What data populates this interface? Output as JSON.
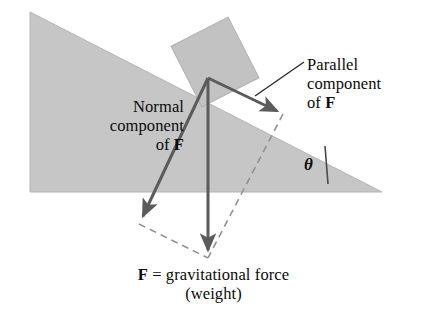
{
  "figure": {
    "background_color": "#ffffff",
    "wedge_fill": "#c6c6c6",
    "block_fill": "#c0c0c0",
    "vector_color": "#5b5b5b",
    "dashed_color": "#8f8f8f",
    "text_color": "#0b0b0b"
  },
  "labels": {
    "normal_line1": "Normal",
    "normal_line2": "component",
    "normal_line3_prefix": "of ",
    "normal_line3_symbol": "F",
    "parallel_line1": "Parallel",
    "parallel_line2": "component",
    "parallel_line3_prefix": "of ",
    "parallel_line3_symbol": "F",
    "theta": "θ",
    "caption_symbol": "F",
    "caption_line1": " = gravitational force",
    "caption_line2": "(weight)"
  },
  "geometry": {
    "wedge_points": "30,12 382,192 30,192",
    "incline_angle_degrees": 27,
    "block_center_x": 215,
    "block_center_y": 62,
    "vector_origin_x": 208,
    "vector_origin_y": 78
  },
  "vectors": [
    {
      "name": "gravitational-force",
      "label": "F = gravitational force (weight)",
      "from_x": 208,
      "from_y": 78,
      "to_x": 208,
      "to_y": 258,
      "style": "solid"
    },
    {
      "name": "normal-component",
      "label": "Normal component of F",
      "from_x": 208,
      "from_y": 78,
      "to_x": 139,
      "to_y": 224,
      "style": "solid"
    },
    {
      "name": "parallel-component",
      "label": "Parallel component of F",
      "from_x": 208,
      "from_y": 78,
      "to_x": 283,
      "to_y": 114,
      "style": "solid"
    }
  ],
  "construction_lines": [
    {
      "name": "dashed-parallel-to-normal",
      "from_x": 283,
      "from_y": 114,
      "to_x": 208,
      "to_y": 258
    },
    {
      "name": "dashed-parallel-to-parallel",
      "from_x": 139,
      "from_y": 224,
      "to_x": 208,
      "to_y": 258
    }
  ],
  "leader_line": {
    "name": "parallel-label-leader",
    "from_x": 255,
    "from_y": 96,
    "to_x": 304,
    "to_y": 62
  },
  "angle_mark": {
    "name": "theta-tick",
    "from_x": 325,
    "from_y": 146,
    "to_x": 328,
    "to_y": 184
  }
}
